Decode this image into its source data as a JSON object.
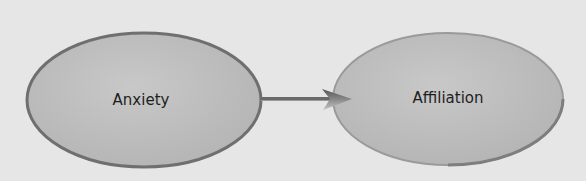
{
  "diagram": {
    "type": "flow",
    "nodes": [
      {
        "id": "anxiety",
        "label": "Anxiety"
      },
      {
        "id": "affiliation",
        "label": "Affiliation"
      }
    ],
    "edges": [
      {
        "from": "anxiety",
        "to": "affiliation"
      }
    ],
    "colors": {
      "background": "#e6e6e6",
      "node_fill": "#c0c0c0",
      "node_border": "#7a7a7a",
      "arrow": "#6e6e6e"
    }
  }
}
